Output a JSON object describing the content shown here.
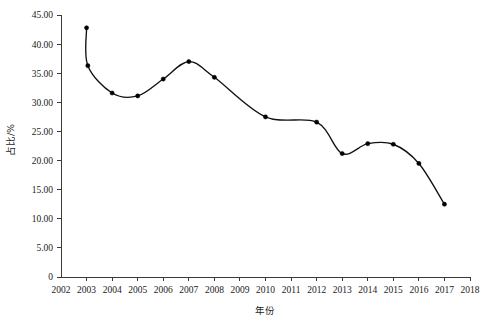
{
  "chart_data": {
    "type": "line",
    "title": "",
    "xlabel": "年份",
    "ylabel": "占比/%",
    "xlim": [
      2002,
      2018
    ],
    "ylim": [
      0,
      45
    ],
    "grid": false,
    "legend": null,
    "x_tick_labels": [
      "2002",
      "2003",
      "2004",
      "2005",
      "2006",
      "2007",
      "2008",
      "2009",
      "2010",
      "2011",
      "2012",
      "2013",
      "2014",
      "2015",
      "2016",
      "2017",
      "2018"
    ],
    "y_tick_labels": [
      "0",
      "5.00",
      "10.00",
      "15.00",
      "20.00",
      "25.00",
      "30.00",
      "35.00",
      "40.00",
      "45.00"
    ],
    "y_tick_values": [
      0,
      5,
      10,
      15,
      20,
      25,
      30,
      35,
      40,
      45
    ],
    "marker": "filled-circle",
    "line_color": "#111111",
    "marker_color": "#000000",
    "series": [
      {
        "name": "占比",
        "points": [
          {
            "x": 2003.0,
            "y": 42.8
          },
          {
            "x": 2003.05,
            "y": 36.3
          },
          {
            "x": 2004,
            "y": 31.6
          },
          {
            "x": 2005,
            "y": 31.1
          },
          {
            "x": 2006,
            "y": 34.0
          },
          {
            "x": 2007,
            "y": 37.0
          },
          {
            "x": 2008,
            "y": 34.3
          },
          {
            "x": 2010,
            "y": 27.5
          },
          {
            "x": 2012,
            "y": 26.6
          },
          {
            "x": 2013,
            "y": 21.2
          },
          {
            "x": 2014,
            "y": 22.9
          },
          {
            "x": 2015,
            "y": 22.8
          },
          {
            "x": 2016,
            "y": 19.5
          },
          {
            "x": 2017,
            "y": 12.5
          }
        ]
      }
    ]
  }
}
